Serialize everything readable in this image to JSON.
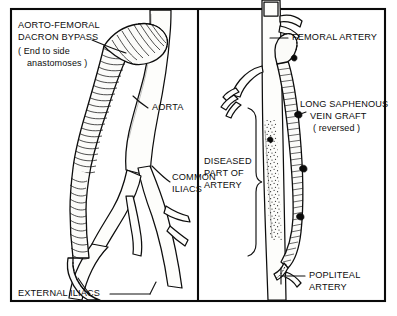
{
  "figure": {
    "background_color": "#ffffff",
    "ink_color": "#0d0d0d",
    "panels": [
      {
        "id": "left",
        "name": "aorto-femoral-dacron-bypass-panel",
        "description": "Aorto-femoral Dacron bypass graft anastomosed to aorta and external iliac arteries"
      },
      {
        "id": "right",
        "name": "long-saphenous-vein-graft-panel",
        "description": "Reversed long saphenous vein graft bypassing diseased femoral artery to popliteal artery"
      }
    ]
  },
  "left_panel": {
    "labels": {
      "bypass_line1": "AORTO-FEMORAL",
      "bypass_line2": "DACRON  BYPASS",
      "bypass_line3": "( End to side",
      "bypass_line4": "anastomoses )",
      "aorta": "AORTA",
      "common_iliacs_line1": "COMMON",
      "common_iliacs_line2": "ILIACS",
      "external_iliacs": "EXTERNAL ILIACS"
    }
  },
  "right_panel": {
    "labels": {
      "femoral_artery": "FEMORAL ARTERY",
      "vein_graft_line1": "LONG SAPHENOUS",
      "vein_graft_line2": "VEIN  GRAFT",
      "vein_graft_line3": "( reversed )",
      "diseased_line1": "DISEASED",
      "diseased_line2": "PART OF",
      "diseased_line3": "ARTERY",
      "popliteal_line1": "POPLITEAL",
      "popliteal_line2": "ARTERY"
    }
  }
}
